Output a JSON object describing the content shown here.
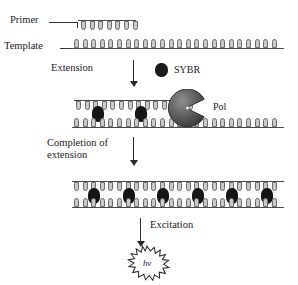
{
  "diagram": {
    "labels": {
      "primer": "Primer",
      "template": "Template",
      "extension": "Extension",
      "sybr": "SYBR",
      "pol": "Pol",
      "completion_line1": "Completion of",
      "completion_line2": "extension",
      "excitation": "Excitation",
      "photon": "hv"
    },
    "colors": {
      "ink": "#23211f",
      "dye": "#151515",
      "enzyme_dark": "#4a4a4a",
      "enzyme_light": "#8d8d8d",
      "nucleotide_fill": "#c9c9c9",
      "nucleotide_stroke": "#6e6e6e",
      "background": "#ffffff"
    },
    "stages": [
      {
        "name": "annealing",
        "strands": [
          {
            "role": "primer",
            "nucleotides": 7,
            "dye_count": 0
          },
          {
            "role": "template",
            "nucleotides": 24,
            "dye_count": 0
          }
        ]
      },
      {
        "name": "extension",
        "enzyme": "Pol",
        "strands": [
          {
            "role": "nascent-strand",
            "nucleotides": 14,
            "dye_count": 3
          },
          {
            "role": "template",
            "nucleotides": 24,
            "dye_count": 0
          }
        ]
      },
      {
        "name": "completed-extension",
        "strands": [
          {
            "role": "nascent-strand",
            "nucleotides": 24,
            "dye_count": 6
          },
          {
            "role": "template",
            "nucleotides": 24,
            "dye_count": 0
          }
        ]
      },
      {
        "name": "excitation",
        "emission": "hv"
      }
    ]
  }
}
